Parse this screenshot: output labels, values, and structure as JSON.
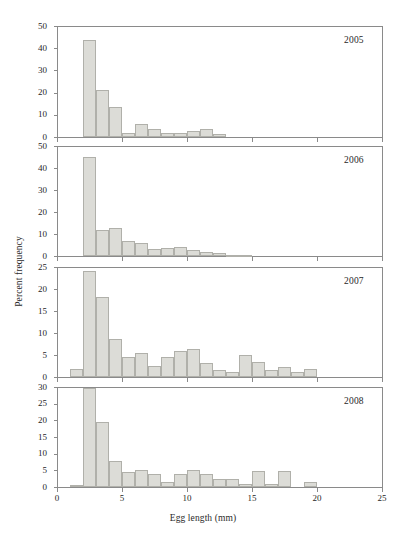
{
  "figure": {
    "xlabel": "Egg length (mm)",
    "ylabel": "Percent frequency",
    "bar_fill": "#dcdcd7",
    "bar_stroke": "#b0b0aa",
    "axis_color": "#8a8a8a"
  },
  "chart_data": [
    {
      "type": "bar",
      "title": "2005",
      "xlabel": "Egg length (mm)",
      "ylabel": "Percent frequency",
      "xlim": [
        0,
        25
      ],
      "ylim": [
        0,
        50
      ],
      "xticks": [
        0,
        5,
        10,
        15,
        20,
        25
      ],
      "yticks": [
        0,
        10,
        20,
        30,
        40,
        50
      ],
      "grid": false,
      "bin_width": 1,
      "x": [
        3,
        4,
        5,
        6,
        7,
        8,
        9,
        10,
        11,
        12,
        13
      ],
      "values": [
        43.5,
        21.0,
        13.5,
        2.0,
        5.7,
        3.5,
        2.0,
        2.0,
        2.5,
        3.7,
        1.2
      ]
    },
    {
      "type": "bar",
      "title": "2006",
      "xlabel": "Egg length (mm)",
      "ylabel": "Percent frequency",
      "xlim": [
        0,
        25
      ],
      "ylim": [
        0,
        50
      ],
      "xticks": [
        0,
        5,
        10,
        15,
        20,
        25
      ],
      "yticks": [
        0,
        10,
        20,
        30,
        40,
        50
      ],
      "grid": false,
      "bin_width": 1,
      "x": [
        3,
        4,
        5,
        6,
        7,
        8,
        9,
        10,
        11,
        12,
        13,
        14,
        15
      ],
      "values": [
        45.0,
        12.0,
        12.8,
        7.0,
        5.7,
        3.4,
        3.5,
        4.3,
        2.8,
        1.8,
        1.3,
        0.5,
        0.6
      ]
    },
    {
      "type": "bar",
      "title": "2007",
      "xlabel": "Egg length (mm)",
      "ylabel": "Percent frequency",
      "xlim": [
        0,
        25
      ],
      "ylim": [
        0,
        25
      ],
      "xticks": [
        0,
        5,
        10,
        15,
        20,
        25
      ],
      "yticks": [
        0,
        5,
        10,
        15,
        20,
        25
      ],
      "grid": false,
      "bin_width": 1,
      "x": [
        2,
        3,
        4,
        5,
        6,
        7,
        8,
        9,
        10,
        11,
        12,
        13,
        14,
        15,
        16,
        17,
        18,
        19,
        20
      ],
      "values": [
        1.9,
        24.2,
        18.2,
        8.7,
        4.5,
        5.4,
        2.6,
        4.5,
        5.9,
        6.4,
        3.1,
        1.6,
        1.1,
        5.1,
        3.3,
        1.7,
        2.2,
        1.2,
        1.8
      ]
    },
    {
      "type": "bar",
      "title": "2008",
      "xlabel": "Egg length (mm)",
      "ylabel": "Percent frequency",
      "xlim": [
        0,
        25
      ],
      "ylim": [
        0,
        30
      ],
      "xticks": [
        0,
        5,
        10,
        15,
        20,
        25
      ],
      "yticks": [
        0,
        5,
        10,
        15,
        20,
        25,
        30
      ],
      "grid": false,
      "bin_width": 1,
      "x": [
        2,
        3,
        4,
        5,
        6,
        7,
        8,
        9,
        10,
        11,
        12,
        13,
        14,
        15,
        16,
        17,
        18,
        20
      ],
      "values": [
        0.6,
        29.8,
        19.4,
        7.8,
        4.5,
        5.2,
        3.9,
        1.5,
        3.9,
        5.2,
        3.9,
        2.4,
        2.4,
        0.8,
        4.7,
        0.9,
        4.7,
        1.6
      ]
    }
  ]
}
